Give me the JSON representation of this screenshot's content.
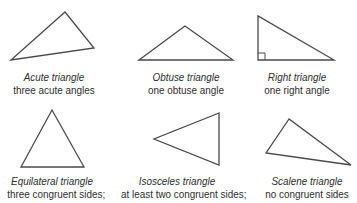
{
  "title_cutoff": "…",
  "triangles": [
    {
      "name": "Acute triangle",
      "description": "three acute angles",
      "points": "65,12 94,48 11,60"
    },
    {
      "name": "Obtuse triangle",
      "description": "one obtuse angle",
      "points": "139,60 185,26 233,60"
    },
    {
      "name": "Right triangle",
      "description": "one right angle",
      "points": "258,16 258,60 334,60"
    },
    {
      "name": "Equilateral triangle",
      "description": "three congruent sides;",
      "points": "52,110 21,167 84,167"
    },
    {
      "name": "Isosceles triangle",
      "description": "at least two congruent sides;",
      "points": "219,113 154,139 219,165"
    },
    {
      "name": "Scalene triangle",
      "description": "no congruent sides",
      "points": "289,119 266,153 351,165"
    }
  ],
  "colors": {
    "stroke": "#4a4a4a",
    "text": "#2e2e2e",
    "background": "#ffffff"
  }
}
